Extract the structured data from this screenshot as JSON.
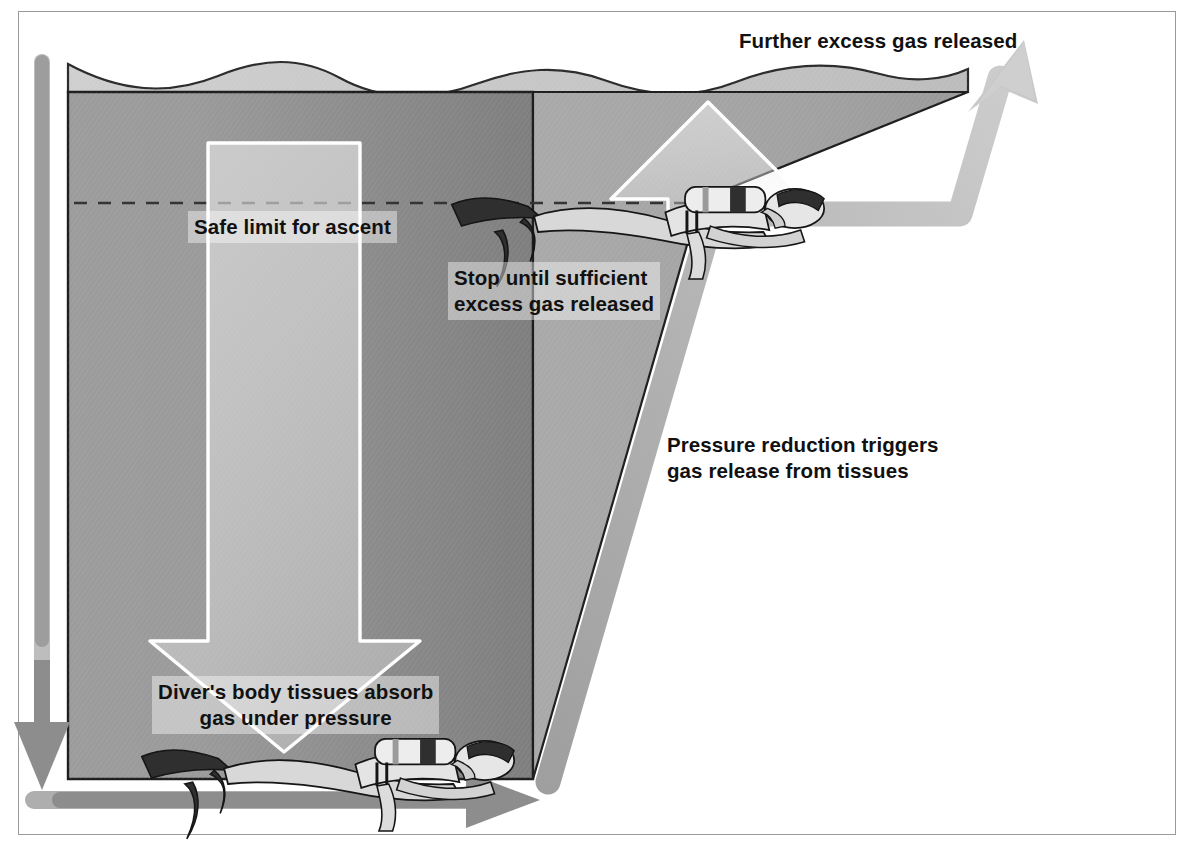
{
  "diagram": {
    "title_visible": false,
    "type": "depth-vs-time profile diagram",
    "axes": {
      "vertical": {
        "name": "depth-axis",
        "direction": "downward",
        "arrow": "down",
        "color": "#8d8d8d"
      },
      "horizontal": {
        "name": "time-axis",
        "direction": "rightward",
        "arrow": "right",
        "color": "#8d8d8d"
      }
    },
    "labels": {
      "further_excess": "Further excess gas released",
      "safe_limit": "Safe limit for ascent",
      "stop_until": "Stop until sufficient\nexcess gas released",
      "pressure_reduction": "Pressure reduction triggers\ngas release from tissues",
      "divers_tissues": "Diver's body tissues absorb\ngas under pressure"
    },
    "icons": {
      "diver_deep": "scuba-diver-icon",
      "diver_stop": "scuba-diver-icon",
      "descent_arrow": "arrow-down-icon",
      "ascent_arrow": "arrow-up-icon",
      "ascent_path_arrow": "arrow-up-right-icon",
      "depth_axis_arrow": "arrow-down-icon",
      "time_axis_arrow": "arrow-right-icon"
    },
    "colors": {
      "water_deep": "#8f8f8f",
      "water_shallow": "#a8a8a8",
      "surface_band": "#c3c3c3",
      "path_stroke": "#b2b2b2",
      "axis_gray": "#8d8d8d",
      "axis_gray_dark": "#6f6f6f",
      "white_arrow": "#ffffff",
      "text": "#111111",
      "frame_border": "#9a9a9a",
      "dashed_limit": "#3a3a3a"
    },
    "regions": {
      "bottom_phase": "diver at depth absorbing gas",
      "stop_phase": "decompression stop at safe limit depth",
      "surface_phase": "at surface releasing further excess gas"
    }
  }
}
